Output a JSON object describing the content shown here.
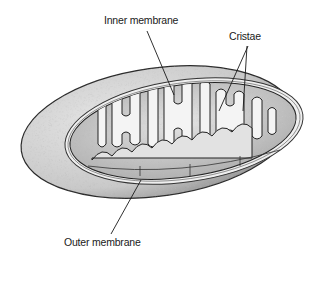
{
  "diagram": {
    "labels": [
      {
        "id": "inner",
        "text": "Inner membrane",
        "x": 104,
        "y": 14
      },
      {
        "id": "cristae",
        "text": "Cristae",
        "x": 229,
        "y": 30
      },
      {
        "id": "outer",
        "text": "Outer membrane",
        "x": 64,
        "y": 236
      }
    ],
    "leader_lines": [
      {
        "for": "inner",
        "x1": 147,
        "y1": 31,
        "x2": 174,
        "y2": 95
      },
      {
        "for": "cristae",
        "x1": 248,
        "y1": 46,
        "x2": 219,
        "y2": 111
      },
      {
        "for": "cristae",
        "x1": 247,
        "y1": 46,
        "x2": 243,
        "y2": 111
      },
      {
        "for": "outer",
        "x1": 141,
        "y1": 180,
        "x2": 111,
        "y2": 234
      }
    ],
    "colors": {
      "outer_fill": "#cfcfcf",
      "outer_stroke": "#2a2a2a",
      "intermembrane": "#ececec",
      "matrix": "#d8d8d8",
      "cristae_fill": "#f4f4f4",
      "cristae_stroke": "#222222",
      "text": "#1a1a1a"
    }
  }
}
